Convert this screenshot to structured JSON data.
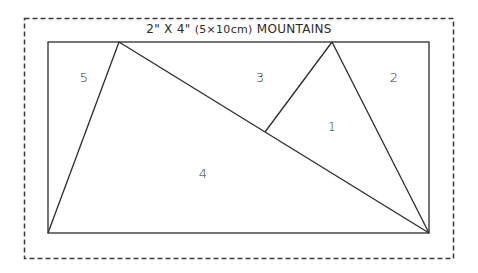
{
  "title": {
    "size": "2\" X 4\"",
    "metric": "(5×10cm)",
    "name": "MOUNTAINS"
  },
  "colors": {
    "line": "#2b2b2b",
    "dashed_border": "#3a3a3a",
    "background": "#ffffff"
  },
  "pieces": [
    {
      "id": "1",
      "label": "1",
      "x": 332,
      "y": 126
    },
    {
      "id": "2",
      "label": "2",
      "x": 394,
      "y": 77
    },
    {
      "id": "3",
      "label": "3",
      "x": 260,
      "y": 77
    },
    {
      "id": "4",
      "label": "4",
      "x": 203,
      "y": 173
    },
    {
      "id": "5",
      "label": "5",
      "x": 84,
      "y": 77
    }
  ]
}
